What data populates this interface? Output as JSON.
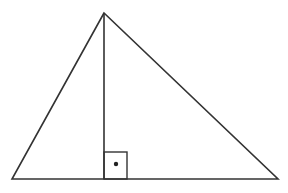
{
  "diagram": {
    "type": "triangle-with-altitude",
    "stroke_color": "#333333",
    "background": "#ffffff",
    "vertices": {
      "apex": [
        104,
        13
      ],
      "base_left": [
        12,
        179
      ],
      "base_right": [
        278,
        179
      ]
    },
    "altitude": {
      "from": [
        104,
        13
      ],
      "foot": [
        104,
        179
      ]
    },
    "right_angle_marker": {
      "x": 104,
      "y": 152,
      "width": 23,
      "height": 27,
      "dot": [
        116,
        164
      ]
    }
  }
}
